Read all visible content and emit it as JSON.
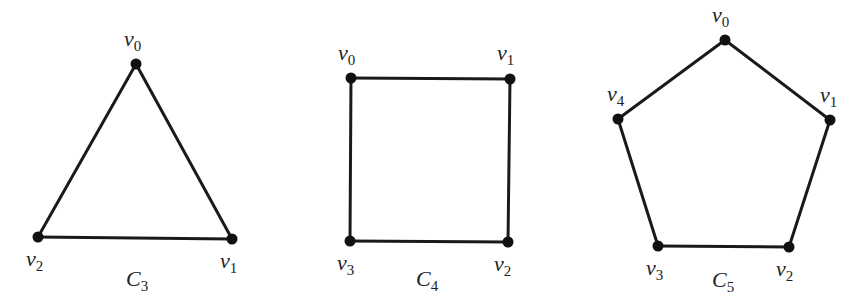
{
  "graphs": [
    {
      "name": "C",
      "subscript": "3",
      "label_pos": [
        126,
        286
      ],
      "vertices": [
        {
          "label": "v",
          "sub": "0",
          "x": 136,
          "y": 64,
          "lx": 124,
          "ly": 46
        },
        {
          "label": "v",
          "sub": "1",
          "x": 232,
          "y": 239,
          "lx": 220,
          "ly": 268
        },
        {
          "label": "v",
          "sub": "2",
          "x": 38,
          "y": 237,
          "lx": 26,
          "ly": 266
        }
      ],
      "edges": [
        [
          0,
          1
        ],
        [
          1,
          2
        ],
        [
          2,
          0
        ]
      ]
    },
    {
      "name": "C",
      "subscript": "4",
      "label_pos": [
        416,
        286
      ],
      "vertices": [
        {
          "label": "v",
          "sub": "0",
          "x": 351,
          "y": 78,
          "lx": 338,
          "ly": 60
        },
        {
          "label": "v",
          "sub": "1",
          "x": 510,
          "y": 79,
          "lx": 497,
          "ly": 60
        },
        {
          "label": "v",
          "sub": "2",
          "x": 508,
          "y": 242,
          "lx": 494,
          "ly": 271
        },
        {
          "label": "v",
          "sub": "3",
          "x": 350,
          "y": 241,
          "lx": 337,
          "ly": 270
        }
      ],
      "edges": [
        [
          0,
          1
        ],
        [
          1,
          2
        ],
        [
          2,
          3
        ],
        [
          3,
          0
        ]
      ]
    },
    {
      "name": "C",
      "subscript": "5",
      "label_pos": [
        712,
        287
      ],
      "vertices": [
        {
          "label": "v",
          "sub": "0",
          "x": 725,
          "y": 40,
          "lx": 712,
          "ly": 22
        },
        {
          "label": "v",
          "sub": "1",
          "x": 830,
          "y": 120,
          "lx": 820,
          "ly": 102
        },
        {
          "label": "v",
          "sub": "2",
          "x": 789,
          "y": 247,
          "lx": 776,
          "ly": 276
        },
        {
          "label": "v",
          "sub": "3",
          "x": 658,
          "y": 246,
          "lx": 646,
          "ly": 275
        },
        {
          "label": "v",
          "sub": "4",
          "x": 618,
          "y": 119,
          "lx": 607,
          "ly": 101
        }
      ],
      "edges": [
        [
          0,
          1
        ],
        [
          1,
          2
        ],
        [
          2,
          3
        ],
        [
          3,
          4
        ],
        [
          4,
          0
        ]
      ]
    }
  ]
}
